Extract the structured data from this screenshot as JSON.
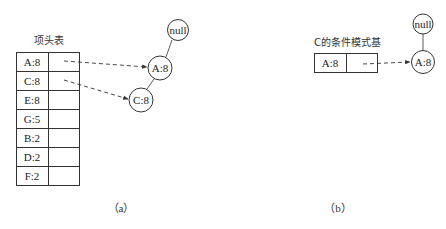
{
  "panel_a": {
    "title": "项头表",
    "caption": "（a）",
    "header_table": {
      "rows": [
        {
          "item": "A:8",
          "link": true
        },
        {
          "item": "C:8",
          "link": true
        },
        {
          "item": "E:8",
          "link": false
        },
        {
          "item": "G:5",
          "link": false
        },
        {
          "item": "B:2",
          "link": false
        },
        {
          "item": "D:2",
          "link": false
        },
        {
          "item": "F:2",
          "link": false
        }
      ]
    },
    "tree_nodes": [
      {
        "id": "null",
        "label": "null"
      },
      {
        "id": "A",
        "label": "A:8"
      },
      {
        "id": "C",
        "label": "C:8"
      }
    ]
  },
  "panel_b": {
    "title": "C的条件模式基",
    "caption": "（b）",
    "header_table": {
      "rows": [
        {
          "item": "A:8",
          "link": true
        }
      ]
    },
    "tree_nodes": [
      {
        "id": "null",
        "label": "null"
      },
      {
        "id": "A",
        "label": "A:8"
      }
    ]
  },
  "colors": {
    "line": "#333333",
    "background": "#ffffff"
  }
}
